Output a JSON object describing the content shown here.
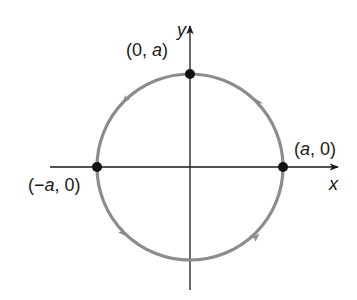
{
  "diagram": {
    "type": "parametric-circle",
    "axes": {
      "x_label": "x",
      "y_label": "y"
    },
    "points": [
      {
        "id": "top",
        "label_prefix": "(0, ",
        "label_var": "a",
        "label_suffix": ")"
      },
      {
        "id": "right",
        "label_prefix": "(",
        "label_var": "a",
        "label_suffix": ", 0)"
      },
      {
        "id": "left",
        "label_prefix": "(−",
        "label_var": "a",
        "label_suffix": ", 0)"
      }
    ],
    "direction": "counterclockwise",
    "colors": {
      "circle": "#8c8c8c",
      "axis": "#1a1a1a",
      "point": "#111111"
    }
  }
}
